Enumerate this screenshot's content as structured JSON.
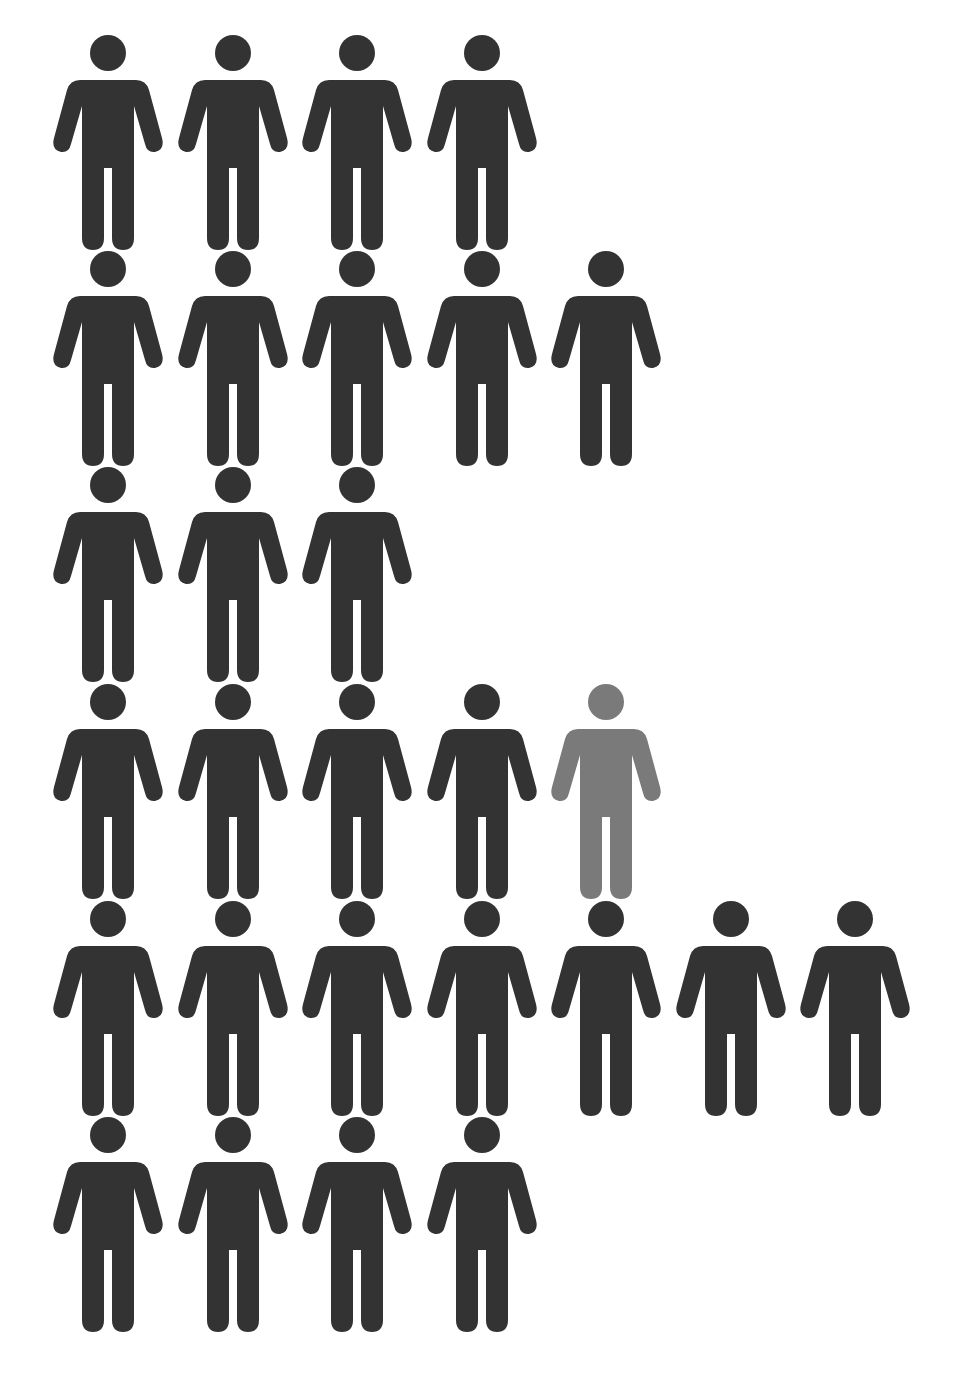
{
  "pictogram": {
    "colors": {
      "default": "#333333",
      "highlight": "#7a7a7a",
      "background": "#ffffff"
    },
    "rows": [
      {
        "top": 34,
        "count": 4,
        "highlight_index": -1
      },
      {
        "top": 250,
        "count": 5,
        "highlight_index": -1
      },
      {
        "top": 466,
        "count": 3,
        "highlight_index": -1
      },
      {
        "top": 683,
        "count": 5,
        "highlight_index": 4
      },
      {
        "top": 900,
        "count": 7,
        "highlight_index": -1
      },
      {
        "top": 1116,
        "count": 4,
        "highlight_index": -1
      }
    ],
    "total_figures": 28,
    "highlighted_figures": 1
  }
}
